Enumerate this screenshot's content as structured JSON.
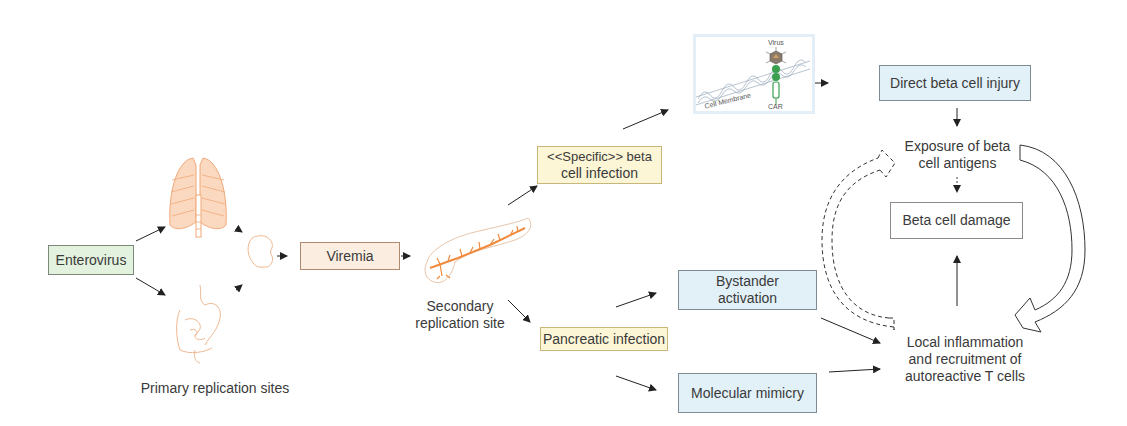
{
  "nodes": {
    "enterovirus": "Enterovirus",
    "primary_sites": "Primary replication sites",
    "viremia": "Viremia",
    "secondary_site_line1": "Secondary",
    "secondary_site_line2": "replication site",
    "specific_infection_line1": "<<Specific>> beta",
    "specific_infection_line2": "cell infection",
    "pancreatic_infection": "Pancreatic infection",
    "direct_injury": "Direct beta cell injury",
    "exposure_line1": "Exposure of beta",
    "exposure_line2": "cell antigens",
    "beta_damage": "Beta cell damage",
    "bystander_line1": "Bystander",
    "bystander_line2": "activation",
    "mimicry": "Molecular mimicry",
    "inflammation_line1": "Local inflammation",
    "inflammation_line2": "and recruitment of",
    "inflammation_line3": "autoreactive T cells"
  },
  "inset": {
    "virus": "Virus",
    "membrane": "Cell Membrane",
    "car": "CAR"
  },
  "colors": {
    "organ": "#f0a878",
    "green_box": "#e3f1df",
    "tan_box": "#fbeee0",
    "yellow_box": "#fdf6d6",
    "blue_box": "#e2f0f7"
  }
}
